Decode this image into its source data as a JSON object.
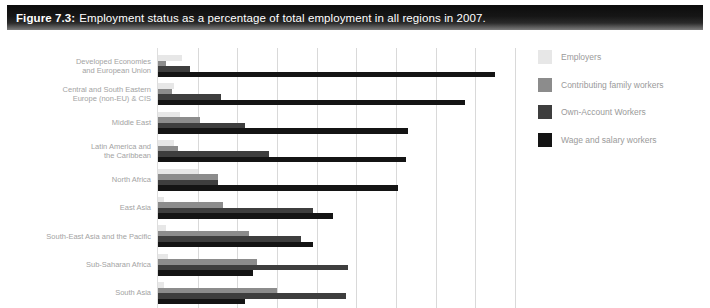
{
  "header": {
    "figure_label": "Figure 7.3:",
    "title": "Employment status as a percentage of total employment in all regions in 2007."
  },
  "chart_data": {
    "type": "bar",
    "orientation": "horizontal",
    "title": "Employment status as a percentage of total employment in all regions in 2007",
    "xlabel": "",
    "ylabel": "",
    "xlim": [
      0,
      90
    ],
    "grid_step": 10,
    "grid": true,
    "x_axis_tick_labels_visible": false,
    "legend_position": "right",
    "categories": [
      "Developed Economies\nand European Union",
      "Central and South Eastern\nEurope (non-EU) & CIS",
      "Middle East",
      "Latin America and\nthe Caribbean",
      "North Africa",
      "East Asia",
      "South-East Asia and the Pacific",
      "Sub-Saharan Africa",
      "South Asia"
    ],
    "series": [
      {
        "name": "Employers",
        "color": "#e7e7e7",
        "values": [
          6,
          4,
          5.5,
          4,
          10,
          1.5,
          2,
          2.5,
          1.5
        ]
      },
      {
        "name": "Contributing family workers",
        "color": "#8c8c8c",
        "values": [
          2,
          3.5,
          10.5,
          5,
          15,
          16.5,
          23,
          25,
          30
        ]
      },
      {
        "name": "Own-Account Workers",
        "color": "#3e3e3e",
        "values": [
          8,
          16,
          22,
          28,
          15,
          39,
          36,
          48,
          47.5
        ]
      },
      {
        "name": "Wage and salary workers",
        "color": "#141414",
        "values": [
          85,
          77.5,
          63,
          62.5,
          60.5,
          44,
          39,
          24,
          22
        ]
      }
    ]
  }
}
